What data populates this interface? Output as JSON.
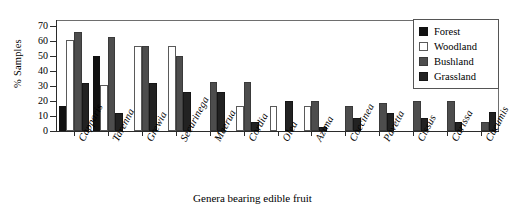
{
  "chart_data": {
    "type": "bar",
    "title": "",
    "xlabel": "Genera bearing edible fruit",
    "ylabel": "% Samples",
    "ylim": [
      0,
      75
    ],
    "yticks": [
      0,
      10,
      20,
      30,
      40,
      50,
      60,
      70
    ],
    "grid": false,
    "legend_position": "top-right",
    "categories": [
      "Capparis",
      "Tarenna",
      "Grewia",
      "Securinega",
      "Maerua",
      "Cordia",
      "Olea",
      "Azima",
      "Coccinea",
      "Pavetta",
      "Cissus",
      "Carissa",
      "Cucumis"
    ],
    "series": [
      {
        "name": "Forest",
        "color": "#111111",
        "values": [
          17,
          50,
          0,
          0,
          0,
          0,
          0,
          0,
          0,
          0,
          0,
          0,
          0
        ]
      },
      {
        "name": "Woodland",
        "color": "#ffffff",
        "values": [
          61,
          31,
          57,
          57,
          0,
          17,
          17,
          17,
          0,
          0,
          0,
          0,
          0
        ]
      },
      {
        "name": "Bushland",
        "color": "#4d4d4d",
        "values": [
          66,
          63,
          57,
          50,
          33,
          33,
          0,
          20,
          17,
          19,
          20,
          20,
          6
        ]
      },
      {
        "name": "Grassland",
        "color": "#222222",
        "values": [
          32,
          12,
          32,
          26,
          26,
          6,
          20,
          3,
          9,
          12,
          9,
          6,
          13
        ]
      }
    ]
  },
  "axes": {
    "ylabel": "% Samples",
    "xlabel": "Genera bearing edible fruit",
    "ytick_labels": [
      "0",
      "10",
      "20",
      "30",
      "40",
      "50",
      "60",
      "70"
    ]
  },
  "legend": {
    "items": [
      {
        "label": "Forest"
      },
      {
        "label": "Woodland"
      },
      {
        "label": "Bushland"
      },
      {
        "label": "Grassland"
      }
    ]
  }
}
